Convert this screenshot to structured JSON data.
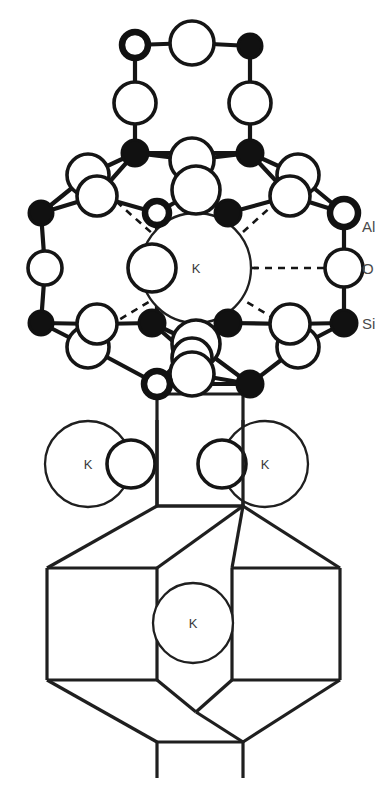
{
  "figure": {
    "background_color": "#ffffff",
    "line_color": "#151515",
    "width": 386,
    "height": 791
  },
  "legend": {
    "items": [
      {
        "key": "al",
        "label": "Al",
        "glyph": "thick-open-circle",
        "x": 352,
        "y": 226
      },
      {
        "key": "o",
        "label": "O",
        "glyph": "thin-open-circle",
        "x": 352,
        "y": 268
      },
      {
        "key": "si",
        "label": "Si",
        "glyph": "filled-circle",
        "x": 352,
        "y": 323
      }
    ]
  },
  "cations": {
    "symbol": "K",
    "sites": [
      {
        "id": "k-center",
        "label": "K",
        "cx": 196,
        "cy": 268,
        "r": 55
      },
      {
        "id": "k-left-mid",
        "label": "K",
        "cx": 88,
        "cy": 464,
        "r": 43
      },
      {
        "id": "k-right-mid",
        "label": "K",
        "cx": 265,
        "cy": 464,
        "r": 43
      },
      {
        "id": "k-cage-bottom",
        "label": "K",
        "cx": 193,
        "cy": 623,
        "r": 40
      }
    ]
  },
  "atoms": {
    "si_label": "Si",
    "al_label": "Al",
    "o_label": "O",
    "si_sites": [
      {
        "cx": 250,
        "cy": 46,
        "r": 12
      },
      {
        "cx": 135,
        "cy": 153,
        "r": 13
      },
      {
        "cx": 250,
        "cy": 153,
        "r": 13
      },
      {
        "cx": 41,
        "cy": 213,
        "r": 12
      },
      {
        "cx": 228,
        "cy": 213,
        "r": 13
      },
      {
        "cx": 344,
        "cy": 323,
        "r": 13
      },
      {
        "cx": 41,
        "cy": 323,
        "r": 12
      },
      {
        "cx": 152,
        "cy": 323,
        "r": 13
      },
      {
        "cx": 228,
        "cy": 323,
        "r": 13
      },
      {
        "cx": 250,
        "cy": 384,
        "r": 13
      }
    ],
    "al_sites": [
      {
        "cx": 135,
        "cy": 45,
        "r": 13
      },
      {
        "cx": 157,
        "cy": 213,
        "r": 12
      },
      {
        "cx": 344,
        "cy": 213,
        "r": 14
      },
      {
        "cx": 157,
        "cy": 384,
        "r": 13
      }
    ],
    "o_sites": [
      {
        "cx": 192,
        "cy": 43,
        "r": 22
      },
      {
        "cx": 135,
        "cy": 103,
        "r": 21
      },
      {
        "cx": 250,
        "cy": 103,
        "r": 21
      },
      {
        "cx": 88,
        "cy": 175,
        "r": 21
      },
      {
        "cx": 192,
        "cy": 160,
        "r": 22
      },
      {
        "cx": 298,
        "cy": 175,
        "r": 21
      },
      {
        "cx": 97,
        "cy": 196,
        "r": 20
      },
      {
        "cx": 196,
        "cy": 190,
        "r": 24
      },
      {
        "cx": 290,
        "cy": 196,
        "r": 20
      },
      {
        "cx": 45,
        "cy": 268,
        "r": 17
      },
      {
        "cx": 344,
        "cy": 268,
        "r": 19
      },
      {
        "cx": 152,
        "cy": 268,
        "r": 24
      },
      {
        "cx": 238,
        "cy": 268,
        "r": 22
      },
      {
        "cx": 88,
        "cy": 347,
        "r": 21
      },
      {
        "cx": 196,
        "cy": 344,
        "r": 24
      },
      {
        "cx": 298,
        "cy": 347,
        "r": 21
      },
      {
        "cx": 97,
        "cy": 324,
        "r": 20
      },
      {
        "cx": 192,
        "cy": 374,
        "r": 22
      },
      {
        "cx": 290,
        "cy": 324,
        "r": 20
      },
      {
        "cx": 192,
        "cy": 358,
        "r": 20
      },
      {
        "cx": 131,
        "cy": 464,
        "r": 24
      },
      {
        "cx": 222,
        "cy": 464,
        "r": 24
      }
    ]
  },
  "cage": {
    "name": "lower-framework-cage",
    "outline_note": "hexagonal-prism cage drawn in outline below the cluster"
  }
}
